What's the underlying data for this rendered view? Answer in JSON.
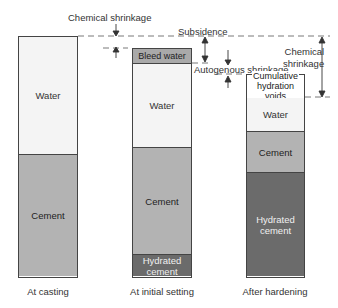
{
  "diagram": {
    "colors": {
      "water": "#f4f4f4",
      "cement": "#b3b3b3",
      "hydrated_cement": "#6b6b6b",
      "bleed_water": "#a9a9a9",
      "outline": "#444444"
    },
    "columns": [
      {
        "id": "at-casting",
        "caption": "At casting",
        "segments": [
          {
            "type": "water",
            "label": "Water"
          },
          {
            "type": "cement",
            "label": "Cement"
          }
        ]
      },
      {
        "id": "at-initial-setting",
        "caption": "At initial setting",
        "segments": [
          {
            "type": "bleed",
            "label": "Bleed water"
          },
          {
            "type": "water",
            "label": "Water"
          },
          {
            "type": "cement",
            "label": "Cement"
          },
          {
            "type": "hydrated",
            "label_line1": "Hydrated",
            "label_line2": "cement"
          }
        ]
      },
      {
        "id": "after-hardening",
        "caption": "After hardening",
        "segments": [
          {
            "type": "voids",
            "label_line1": "Cumulative",
            "label_line2": "hydration voids"
          },
          {
            "type": "water",
            "label": "Water"
          },
          {
            "type": "cement",
            "label": "Cement"
          },
          {
            "type": "hydrated",
            "label_line1": "Hydrated",
            "label_line2": "cement"
          }
        ]
      }
    ],
    "annotations": {
      "chemical_shrinkage_top": "Chemical shrinkage",
      "subsidence": "Subsidence",
      "autogenous_shrinkage": "Autogenous shrinkage",
      "chemical_shrinkage_right_line1": "Chemical",
      "chemical_shrinkage_right_line2": "shrinkage"
    }
  }
}
